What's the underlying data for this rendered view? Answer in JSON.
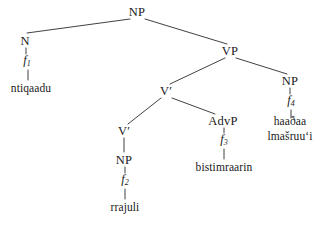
{
  "figure": {
    "kind": "syntax-tree"
  },
  "nodes": {
    "root_np": {
      "label": "NP",
      "x": 137,
      "y": 12
    },
    "n_left": {
      "label": "N",
      "x": 25,
      "y": 41
    },
    "f1": {
      "base": "f",
      "sub": "1",
      "x": 27,
      "y": 61
    },
    "ntiqaadu": {
      "label": "ntiqaadu",
      "x": 31,
      "y": 89
    },
    "vp": {
      "label": "VP",
      "x": 230,
      "y": 51
    },
    "vbar_upper": {
      "label": "V′",
      "x": 166,
      "y": 91
    },
    "np_right": {
      "label": "NP",
      "x": 290,
      "y": 81
    },
    "f4": {
      "base": "f",
      "sub": "4",
      "x": 291,
      "y": 101
    },
    "haadaa": {
      "line1": "haaðaa",
      "line2": "lmašruuʻi",
      "x": 290,
      "y": 129
    },
    "advp": {
      "label": "AdvP",
      "x": 223,
      "y": 121
    },
    "f3": {
      "base": "f",
      "sub": "3",
      "x": 224,
      "y": 140
    },
    "bistimraarin": {
      "label": "bistimraarin",
      "x": 224,
      "y": 168
    },
    "vbar_lower": {
      "label": "V′",
      "x": 124,
      "y": 131
    },
    "np_lower": {
      "label": "NP",
      "x": 124,
      "y": 160
    },
    "f2": {
      "base": "f",
      "sub": "2",
      "x": 125,
      "y": 180
    },
    "rrajuli": {
      "label": "rrajuli",
      "x": 125,
      "y": 208
    }
  },
  "edges": [
    {
      "from": "root_np",
      "to": "n_left",
      "x1": 130,
      "y1": 19,
      "x2": 27,
      "y2": 33
    },
    {
      "from": "root_np",
      "to": "vp",
      "x1": 145,
      "y1": 19,
      "x2": 227,
      "y2": 44
    },
    {
      "from": "n_left",
      "to": "f1",
      "x1": 26,
      "y1": 48,
      "x2": 26,
      "y2": 54
    },
    {
      "from": "f1",
      "to": "ntiqaadu",
      "x1": 28,
      "y1": 70,
      "x2": 28,
      "y2": 80
    },
    {
      "from": "vp",
      "to": "vbar_upper",
      "x1": 225,
      "y1": 58,
      "x2": 170,
      "y2": 84
    },
    {
      "from": "vp",
      "to": "np_right",
      "x1": 236,
      "y1": 58,
      "x2": 287,
      "y2": 74
    },
    {
      "from": "np_right",
      "to": "f4",
      "x1": 290,
      "y1": 88,
      "x2": 290,
      "y2": 94
    },
    {
      "from": "f4",
      "to": "haadaa",
      "x1": 291,
      "y1": 110,
      "x2": 291,
      "y2": 118
    },
    {
      "from": "vbar_upper",
      "to": "vbar_lower",
      "x1": 161,
      "y1": 98,
      "x2": 128,
      "y2": 124
    },
    {
      "from": "vbar_upper",
      "to": "advp",
      "x1": 172,
      "y1": 98,
      "x2": 215,
      "y2": 114
    },
    {
      "from": "advp",
      "to": "f3",
      "x1": 224,
      "y1": 128,
      "x2": 224,
      "y2": 133
    },
    {
      "from": "f3",
      "to": "bistimraarin",
      "x1": 224,
      "y1": 149,
      "x2": 224,
      "y2": 159
    },
    {
      "from": "vbar_lower",
      "to": "np_lower",
      "x1": 124,
      "y1": 138,
      "x2": 124,
      "y2": 152
    },
    {
      "from": "np_lower",
      "to": "f2",
      "x1": 125,
      "y1": 167,
      "x2": 125,
      "y2": 173
    },
    {
      "from": "f2",
      "to": "rrajuli",
      "x1": 125,
      "y1": 189,
      "x2": 125,
      "y2": 199
    }
  ]
}
